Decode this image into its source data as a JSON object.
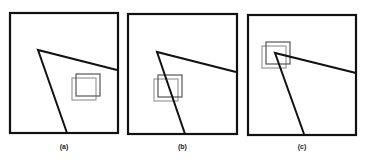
{
  "figure": {
    "panels": [
      {
        "label": "(a)",
        "frame": {
          "x": 10,
          "y": 13,
          "w": 108,
          "h": 120
        },
        "polyline": [
          [
            117,
            70
          ],
          [
            38,
            50
          ],
          [
            67,
            133
          ]
        ],
        "box_dark": {
          "x": 76,
          "y": 74,
          "w": 24,
          "h": 22
        },
        "box_light": {
          "x": 72,
          "y": 78,
          "w": 24,
          "h": 22
        }
      },
      {
        "label": "(b)",
        "frame": {
          "x": 128,
          "y": 14,
          "w": 109,
          "h": 120
        },
        "polyline": [
          [
            236,
            72
          ],
          [
            157,
            52
          ],
          [
            185,
            134
          ]
        ],
        "box_dark": {
          "x": 158,
          "y": 75,
          "w": 24,
          "h": 22
        },
        "box_light": {
          "x": 154,
          "y": 79,
          "w": 24,
          "h": 22
        }
      },
      {
        "label": "(c)",
        "frame": {
          "x": 248,
          "y": 15,
          "w": 108,
          "h": 120
        },
        "polyline": [
          [
            356,
            73
          ],
          [
            275,
            53
          ],
          [
            304,
            134
          ]
        ],
        "box_dark": {
          "x": 266,
          "y": 42,
          "w": 24,
          "h": 22
        },
        "box_light": {
          "x": 262,
          "y": 46,
          "w": 24,
          "h": 22
        }
      }
    ],
    "colors": {
      "stroke": "#111111",
      "box_dark": "#555555",
      "box_light": "#9a9a9a"
    }
  }
}
